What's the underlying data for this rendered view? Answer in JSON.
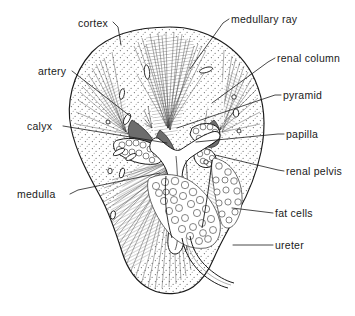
{
  "figure": {
    "view": "coronal section",
    "style": "pen-and-ink line drawing, stippled cortex",
    "background_color": "#ffffff",
    "ink_color": "#1a1a1a"
  },
  "labels": [
    {
      "id": "cortex",
      "text": "cortex",
      "text_x": 78,
      "text_y": 27,
      "anchor": "start",
      "leader": "M113,22 L118,27 L121,45",
      "target_x": 121,
      "target_y": 45
    },
    {
      "id": "medullary-ray",
      "text": "medullary ray",
      "text_x": 231,
      "text_y": 23,
      "anchor": "start",
      "leader": "M229,19 L223,23 L190,69",
      "target_x": 190,
      "target_y": 69
    },
    {
      "id": "renal-column",
      "text": "renal column",
      "text_x": 277,
      "text_y": 62,
      "anchor": "start",
      "leader": "M275,58 L268,62 L212,103",
      "target_x": 212,
      "target_y": 103
    },
    {
      "id": "artery",
      "text": "artery",
      "text_x": 38,
      "text_y": 75,
      "anchor": "start",
      "leader": "M72,71 L130,116",
      "target_x": 130,
      "target_y": 116
    },
    {
      "id": "pyramid",
      "text": "pyramid",
      "text_x": 283,
      "text_y": 99,
      "anchor": "start",
      "leader": "M281,95 L275,95 L177,128",
      "target_x": 177,
      "target_y": 128
    },
    {
      "id": "calyx",
      "text": "calyx",
      "text_x": 27,
      "text_y": 130,
      "anchor": "start",
      "leader": "M63,126 L167,143",
      "target_x": 167,
      "target_y": 143
    },
    {
      "id": "papilla",
      "text": "papilla",
      "text_x": 286,
      "text_y": 138,
      "anchor": "start",
      "leader": "M284,134 L278,134 L196,142",
      "target_x": 196,
      "target_y": 142
    },
    {
      "id": "renal-pelvis",
      "text": "renal pelvis",
      "text_x": 286,
      "text_y": 175,
      "anchor": "start",
      "leader": "M284,171 L278,170 L215,155",
      "target_x": 215,
      "target_y": 155
    },
    {
      "id": "medulla",
      "text": "medulla",
      "text_x": 17,
      "text_y": 198,
      "anchor": "start",
      "leader": "M70,194 L78,190 L160,173",
      "target_x": 160,
      "target_y": 173
    },
    {
      "id": "fat-cells",
      "text": "fat cells",
      "text_x": 275,
      "text_y": 217,
      "anchor": "start",
      "leader": "M273,213 L232,208",
      "target_x": 232,
      "target_y": 208
    },
    {
      "id": "ureter",
      "text": "ureter",
      "text_x": 275,
      "text_y": 249,
      "anchor": "start",
      "leader": "M273,245 L233,245",
      "target_x": 233,
      "target_y": 245
    }
  ],
  "structures": {
    "kidney_outline": "M170,27 C205,27 240,46 255,80 C266,105 266,128 261,152 C256,176 247,196 238,212 C229,228 220,244 214,258 C209,270 203,280 193,287 C181,295 164,296 150,289 C136,282 127,268 122,252 C116,233 110,214 100,196 C88,174 76,152 71,128 C66,104 72,74 92,52 C112,32 142,27 170,27 Z",
    "hilum_note": "central medial indentation where pelvis and ureter exit",
    "cortex_texture": "stipple dots",
    "medulla_texture": "fine radiating striations",
    "pyramid_count": 4,
    "calyx_count": 3
  }
}
